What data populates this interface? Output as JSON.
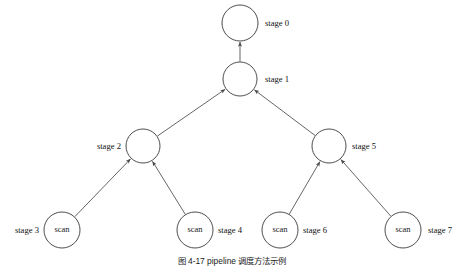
{
  "figure": {
    "background_color": "#ffffff",
    "stroke_color": "#3a3a3a",
    "edge_color": "#4a4a4a",
    "text_color": "#111111",
    "caption": "图 4-17  pipeline  调度方法示例"
  },
  "nodes": [
    {
      "id": "stage0",
      "label": "stage 0",
      "inner_text": "",
      "cx": 240,
      "cy": 23,
      "r": 18,
      "label_x": 265,
      "label_y": 24,
      "label_anchor": "start"
    },
    {
      "id": "stage1",
      "label": "stage 1",
      "inner_text": "",
      "cx": 240,
      "cy": 79,
      "r": 17,
      "label_x": 265,
      "label_y": 80,
      "label_anchor": "start"
    },
    {
      "id": "stage2",
      "label": "stage 2",
      "inner_text": "",
      "cx": 143,
      "cy": 146,
      "r": 17,
      "label_x": 121,
      "label_y": 147,
      "label_anchor": "end"
    },
    {
      "id": "stage5",
      "label": "stage 5",
      "inner_text": "",
      "cx": 329,
      "cy": 146,
      "r": 17,
      "label_x": 352,
      "label_y": 147,
      "label_anchor": "start"
    },
    {
      "id": "stage3",
      "label": "stage 3",
      "inner_text": "scan",
      "cx": 62,
      "cy": 230,
      "r": 18,
      "label_x": 39,
      "label_y": 231,
      "label_anchor": "end"
    },
    {
      "id": "stage4",
      "label": "stage 4",
      "inner_text": "scan",
      "cx": 195,
      "cy": 230,
      "r": 18,
      "label_x": 218,
      "label_y": 231,
      "label_anchor": "start"
    },
    {
      "id": "stage6",
      "label": "stage 6",
      "inner_text": "scan",
      "cx": 280,
      "cy": 230,
      "r": 18,
      "label_x": 303,
      "label_y": 231,
      "label_anchor": "start"
    },
    {
      "id": "stage7",
      "label": "stage 7",
      "inner_text": "scan",
      "cx": 403,
      "cy": 230,
      "r": 18,
      "label_x": 428,
      "label_y": 231,
      "label_anchor": "start"
    }
  ],
  "edges": [
    {
      "id": "edge-stage1-to-stage0",
      "from": "stage1",
      "to": "stage0",
      "direction": "child-to-parent"
    },
    {
      "id": "edge-stage2-to-stage1",
      "from": "stage2",
      "to": "stage1",
      "direction": "child-to-parent"
    },
    {
      "id": "edge-stage5-to-stage1",
      "from": "stage5",
      "to": "stage1",
      "direction": "child-to-parent"
    },
    {
      "id": "edge-stage3-to-stage2",
      "from": "stage3",
      "to": "stage2",
      "direction": "child-to-parent"
    },
    {
      "id": "edge-stage4-to-stage2",
      "from": "stage4",
      "to": "stage2",
      "direction": "child-to-parent"
    },
    {
      "id": "edge-stage6-to-stage5",
      "from": "stage6",
      "to": "stage5",
      "direction": "child-to-parent"
    },
    {
      "id": "edge-stage7-to-stage5",
      "from": "stage7",
      "to": "stage5",
      "direction": "child-to-parent"
    }
  ],
  "caption_block": {
    "text": "图 4-17  pipeline  调度方法示例",
    "x": 232,
    "y": 262
  }
}
